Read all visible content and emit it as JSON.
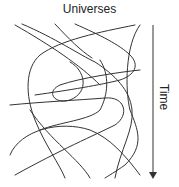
{
  "diagram": {
    "title": "Universes",
    "axis_label": "Time",
    "line_color": "#333333",
    "arrow_color": "#333333",
    "arrow": {
      "x": 153,
      "y1": 25,
      "y2": 178
    }
  }
}
